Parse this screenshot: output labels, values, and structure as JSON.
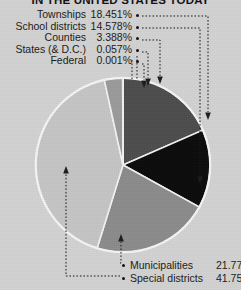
{
  "title": "IN THE UNITED STATES TODAY",
  "background_color": "#d2d2d2",
  "left_labels": [
    {
      "name": "Townships",
      "value": "18.451%"
    },
    {
      "name": "School districts",
      "value": "14.578%"
    },
    {
      "name": "Counties",
      "value": "3.388%"
    },
    {
      "name": "States (& D.C.)",
      "value": "0.057%"
    },
    {
      "name": "Federal",
      "value": "0.001%"
    }
  ],
  "bottom_labels": [
    {
      "name": "Municipalities",
      "value": "21.772%"
    },
    {
      "name": "Special districts",
      "value": "41.753%"
    }
  ],
  "chart_data": {
    "type": "pie",
    "title": "IN THE UNITED STATES TODAY",
    "xlabel": "",
    "ylabel": "",
    "units": "percent",
    "legend_position": "callout-labels",
    "grid": false,
    "total": 100.0,
    "categories": [
      "Townships",
      "School districts",
      "Counties",
      "States (& D.C.)",
      "Federal",
      "Municipalities",
      "Special districts"
    ],
    "values": [
      18.451,
      14.578,
      3.388,
      0.057,
      0.001,
      21.772,
      41.753
    ],
    "slices": [
      {
        "label": "Townships",
        "value": 18.451,
        "color": "#4d4d4d",
        "start_deg": 0.0,
        "end_deg": 66.424
      },
      {
        "label": "School districts",
        "value": 14.578,
        "color": "#0b0b0b",
        "start_deg": 66.424,
        "end_deg": 118.905
      },
      {
        "label": "Municipalities",
        "value": 21.772,
        "color": "#8b8b8b",
        "start_deg": 118.905,
        "end_deg": 197.284
      },
      {
        "label": "Special districts",
        "value": 41.753,
        "color": "#c5c5c5",
        "start_deg": 197.284,
        "end_deg": 347.594
      },
      {
        "label": "Counties",
        "value": 3.388,
        "color": "#9a9a9a",
        "start_deg": 347.594,
        "end_deg": 359.791
      },
      {
        "label": "States (& D.C.)",
        "value": 0.057,
        "color": "#3a3a3a",
        "start_deg": 359.791,
        "end_deg": 359.996
      },
      {
        "label": "Federal",
        "value": 0.001,
        "color": "#101010",
        "start_deg": 359.996,
        "end_deg": 360.0
      }
    ]
  }
}
